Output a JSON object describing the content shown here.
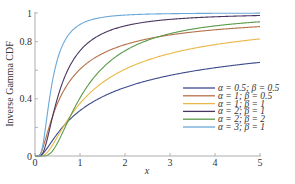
{
  "chart_data": {
    "type": "line",
    "title": "",
    "xlabel": "x",
    "ylabel": "Inverse Gamma CDF",
    "xlim": [
      0,
      5
    ],
    "ylim": [
      0,
      1
    ],
    "x_ticks": [
      0,
      1,
      2,
      3,
      4,
      5
    ],
    "x_tick_labels": [
      "0",
      "1",
      "2",
      "3",
      "4",
      "5"
    ],
    "y_ticks": [
      0,
      0.2,
      0.4,
      0.6,
      0.8,
      1
    ],
    "y_tick_labels": [
      "0",
      "",
      "0.4",
      "",
      "0.8",
      "1"
    ],
    "grid": false,
    "legend_position": "lower right",
    "function": "Q(alpha, beta/x)",
    "series": [
      {
        "name": "α = 0.5; β = 0.5",
        "alpha": 0.5,
        "beta": 0.5,
        "color": "#3d4a8c",
        "x": [
          0.5,
          1,
          2,
          3,
          4,
          5
        ],
        "values": [
          0.32,
          0.48,
          0.62,
          0.68,
          0.72,
          0.75
        ]
      },
      {
        "name": "α = 1; β = 0.5",
        "alpha": 1,
        "beta": 0.5,
        "color": "#b5714a",
        "x": [
          0.5,
          1,
          2,
          3,
          4,
          5
        ],
        "values": [
          0.37,
          0.61,
          0.78,
          0.85,
          0.88,
          0.9
        ]
      },
      {
        "name": "α = 1; β = 1",
        "alpha": 1,
        "beta": 1,
        "color": "#e8b84a",
        "x": [
          0.5,
          1,
          2,
          3,
          4,
          5
        ],
        "values": [
          0.14,
          0.37,
          0.61,
          0.72,
          0.78,
          0.82
        ]
      },
      {
        "name": "α = 2; β = 1",
        "alpha": 2,
        "beta": 1,
        "color": "#4a3560",
        "x": [
          0.5,
          1,
          2,
          3,
          4,
          5
        ],
        "values": [
          0.41,
          0.74,
          0.91,
          0.96,
          0.97,
          0.98
        ]
      },
      {
        "name": "α = 2; β = 2",
        "alpha": 2,
        "beta": 2,
        "color": "#5a9a4a",
        "x": [
          0.5,
          1,
          2,
          3,
          4,
          5
        ],
        "values": [
          0.09,
          0.41,
          0.74,
          0.86,
          0.91,
          0.94
        ]
      },
      {
        "name": "α = 3; β = 1",
        "alpha": 3,
        "beta": 1,
        "color": "#6aa8d8",
        "x": [
          0.5,
          1,
          2,
          3,
          4,
          5
        ],
        "values": [
          0.68,
          0.92,
          0.99,
          1.0,
          1.0,
          1.0
        ]
      }
    ]
  },
  "legend": {
    "items": [
      {
        "label": "α = 0.5; β = 0.5",
        "color": "#3d4a8c"
      },
      {
        "label": "α = 1; β = 0.5",
        "color": "#b5714a"
      },
      {
        "label": "α = 1; β = 1",
        "color": "#e8b84a"
      },
      {
        "label": "α = 2; β = 1",
        "color": "#4a3560"
      },
      {
        "label": "α = 2; β = 2",
        "color": "#5a9a4a"
      },
      {
        "label": "α = 3; β = 1",
        "color": "#6aa8d8"
      }
    ]
  },
  "axes": {
    "xlabel": "x",
    "ylabel": "Inverse Gamma CDF"
  }
}
